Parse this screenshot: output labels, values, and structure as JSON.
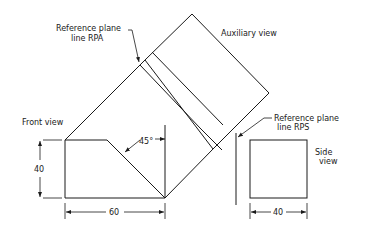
{
  "drawing": {
    "type": "auxiliary-view projection",
    "labels": {
      "rpa_line1": "Reference plane",
      "rpa_line2": "line RPA",
      "auxiliary_view": "Auxiliary view",
      "rps_line1": "Reference plane",
      "rps_line2": "line RPS",
      "front_view": "Front view",
      "side_view_line1": "Side",
      "side_view_line2": "view"
    },
    "dimensions": {
      "front_height": "40",
      "front_width": "60",
      "angle": "45°",
      "side_width": "40"
    },
    "colors": {
      "line": "#1a1a1a",
      "background": "#ffffff"
    }
  }
}
